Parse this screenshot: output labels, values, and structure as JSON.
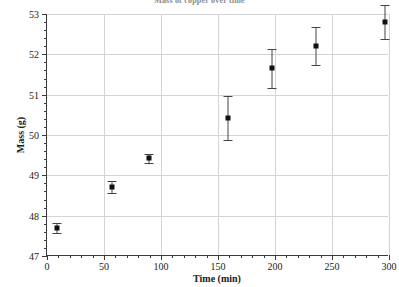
{
  "chart_data": {
    "type": "scatter",
    "title": "Mass of copper over time",
    "xlabel": "Time (min)",
    "ylabel": "Mass (g)",
    "xlim": [
      0,
      300
    ],
    "ylim": [
      47,
      53
    ],
    "grid": true,
    "legend": null,
    "xticks": [
      0,
      50,
      100,
      150,
      200,
      250,
      300
    ],
    "yticks": [
      47,
      48,
      49,
      50,
      51,
      52,
      53
    ],
    "x_minor_step": 10,
    "y_minor_step": 0.2,
    "marker": "square",
    "marker_color": "#111111",
    "errorbar_color": "#444444",
    "grid_color": "#d4d4d4",
    "axis_color": "#3a3a3a",
    "points": [
      {
        "x": 10,
        "y": 47.7,
        "yerr": 0.12
      },
      {
        "x": 58,
        "y": 48.7,
        "yerr": 0.15
      },
      {
        "x": 90,
        "y": 49.42,
        "yerr": 0.12
      },
      {
        "x": 160,
        "y": 50.42,
        "yerr": 0.55
      },
      {
        "x": 198,
        "y": 51.65,
        "yerr": 0.48
      },
      {
        "x": 237,
        "y": 52.2,
        "yerr": 0.47
      },
      {
        "x": 297,
        "y": 52.8,
        "yerr": 0.42
      }
    ]
  }
}
